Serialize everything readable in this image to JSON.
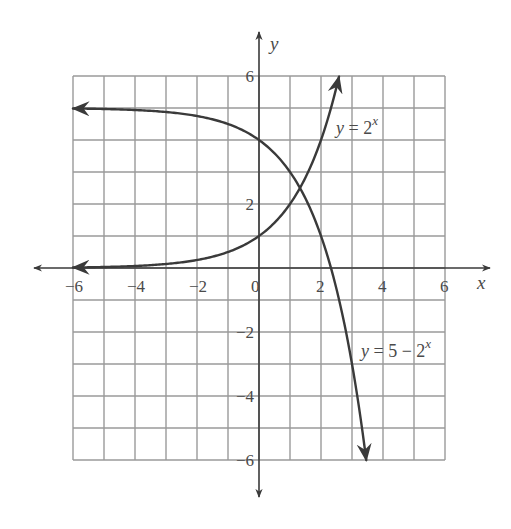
{
  "chart_data": {
    "type": "line",
    "title": "",
    "xlabel": "x",
    "ylabel": "y",
    "xlim": [
      -6,
      6
    ],
    "ylim": [
      -6,
      6
    ],
    "grid": true,
    "grid_step": 1,
    "x_ticks": [
      -6,
      -4,
      -2,
      0,
      2,
      4,
      6
    ],
    "y_ticks": [
      -6,
      -4,
      -2,
      2,
      6
    ],
    "x_tick_labels": [
      "−6",
      "−4",
      "−2",
      "0",
      "2",
      "4",
      "6"
    ],
    "y_tick_labels": [
      "−6",
      "−4",
      "−2",
      "2",
      "6"
    ],
    "series": [
      {
        "name": "y = 2^x",
        "label_parts": {
          "lhs": "y",
          "eq": " = 2",
          "exp": "x"
        },
        "formula": "2^x",
        "x": [
          -6,
          -5,
          -4,
          -3,
          -2,
          -1,
          0,
          1,
          2,
          2.58
        ],
        "y": [
          0.016,
          0.031,
          0.063,
          0.125,
          0.25,
          0.5,
          1,
          2,
          4,
          6
        ],
        "arrow_ends": [
          "left",
          "right"
        ]
      },
      {
        "name": "y = 5 − 2^x",
        "label_parts": {
          "lhs": "y",
          "eq": " = 5 − 2",
          "exp": "x"
        },
        "formula": "5-2^x",
        "x": [
          -6,
          -5,
          -4,
          -3,
          -2,
          -1,
          0,
          1,
          2,
          3,
          3.46
        ],
        "y": [
          4.98,
          4.97,
          4.94,
          4.88,
          4.75,
          4.5,
          4,
          3,
          1,
          -3,
          -6
        ],
        "arrow_ends": [
          "left",
          "right"
        ]
      }
    ],
    "annotations": [
      {
        "text": "y = 2^x",
        "near": [
          2.6,
          5
        ]
      },
      {
        "text": "y = 5 − 2^x",
        "near": [
          3.4,
          -2.5
        ]
      }
    ],
    "intersection": {
      "x": 1.32,
      "y": 2.5
    }
  },
  "axes": {
    "x_name": "x",
    "y_name": "y"
  },
  "colors": {
    "grid": "#9a9a9a",
    "axis": "#3a3a3a",
    "curve": "#3a3a3a",
    "text": "#4a4a4a",
    "background": "#ffffff"
  }
}
